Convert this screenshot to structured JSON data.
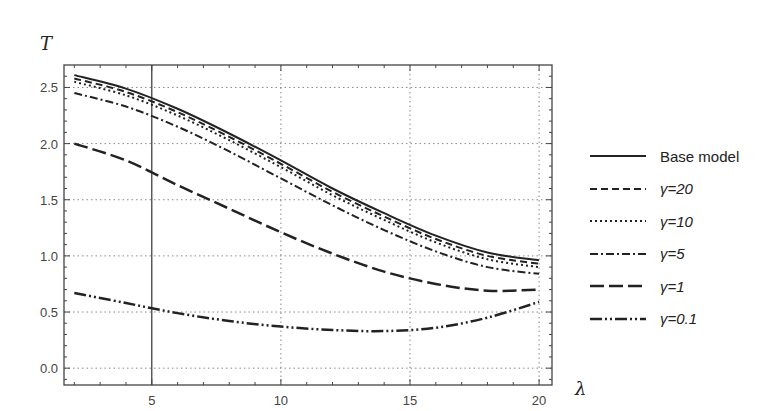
{
  "chart_data": {
    "type": "line",
    "title": "",
    "xlabel": "λ",
    "ylabel": "T",
    "xlim": [
      1.6,
      20.5
    ],
    "ylim": [
      -0.15,
      2.7
    ],
    "xticks": [
      5,
      10,
      15,
      20
    ],
    "yticks": [
      0.0,
      0.5,
      1.0,
      1.5,
      2.0,
      2.5
    ],
    "xtick_labels": [
      "5",
      "10",
      "15",
      "20"
    ],
    "ytick_labels": [
      "0.0",
      "0.5",
      "1.0",
      "1.5",
      "2.0",
      "2.5"
    ],
    "grid": true,
    "reference_line_x": 5,
    "legend_position": "right",
    "x": [
      2,
      4,
      6,
      8,
      10,
      12,
      14,
      16,
      18,
      20
    ],
    "series": [
      {
        "name": "Base model",
        "style": "solid",
        "values": [
          2.61,
          2.49,
          2.31,
          2.09,
          1.85,
          1.6,
          1.38,
          1.18,
          1.03,
          0.96
        ]
      },
      {
        "name": "γ=20",
        "style": "dashed",
        "values": [
          2.58,
          2.46,
          2.28,
          2.06,
          1.82,
          1.57,
          1.35,
          1.15,
          1.0,
          0.93
        ]
      },
      {
        "name": "γ=10",
        "style": "dotted",
        "values": [
          2.55,
          2.43,
          2.25,
          2.03,
          1.79,
          1.54,
          1.32,
          1.12,
          0.97,
          0.9
        ]
      },
      {
        "name": "γ=5",
        "style": "dashdot",
        "values": [
          2.45,
          2.33,
          2.15,
          1.93,
          1.69,
          1.45,
          1.23,
          1.04,
          0.9,
          0.84
        ]
      },
      {
        "name": "γ=1",
        "style": "longdash",
        "values": [
          2.0,
          1.85,
          1.63,
          1.42,
          1.21,
          1.02,
          0.86,
          0.75,
          0.69,
          0.7
        ]
      },
      {
        "name": "γ=0.1",
        "style": "dashdotdot",
        "values": [
          0.67,
          0.58,
          0.49,
          0.42,
          0.37,
          0.34,
          0.33,
          0.36,
          0.45,
          0.59
        ]
      }
    ]
  },
  "legend": {
    "items": [
      {
        "label": "Base model"
      },
      {
        "label": "γ=20"
      },
      {
        "label": "γ=10"
      },
      {
        "label": "γ=5"
      },
      {
        "label": "γ=1"
      },
      {
        "label": "γ=0.1"
      }
    ]
  }
}
